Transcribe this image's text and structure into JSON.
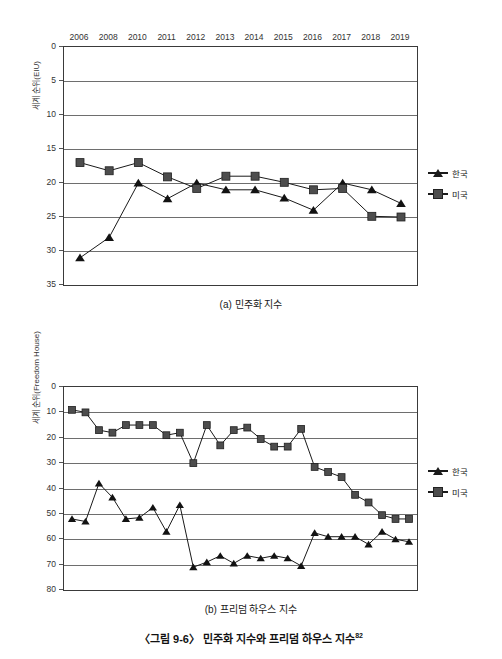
{
  "figure": {
    "caption": "〈그림 9-6〉 민주화 지수와 프리덤 하우스 지수",
    "footnote_marker": "82"
  },
  "legend": {
    "korea_label": "한국",
    "usa_label": "미국",
    "korea_marker": "triangle-marker",
    "usa_marker": "square-marker",
    "korea_color": "#1a1a1a",
    "usa_color": "#4d4d4d"
  },
  "chart_data": [
    {
      "id": "democracy-index",
      "type": "line",
      "title": "(a) 민주화 지수",
      "xlabel": "",
      "ylabel": "세계 순위(EIU)",
      "x_axis_position": "top",
      "y_inverted": true,
      "ylim": [
        0,
        35
      ],
      "yticks": [
        0,
        5,
        10,
        15,
        20,
        25,
        30,
        35
      ],
      "grid": true,
      "legend_position": "right",
      "categories": [
        "2006",
        "2008",
        "2010",
        "2011",
        "2012",
        "2013",
        "2014",
        "2015",
        "2016",
        "2017",
        "2018",
        "2019"
      ],
      "series": [
        {
          "name": "한국",
          "marker": "triangle",
          "values": [
            31,
            28,
            20,
            22.3,
            20,
            21,
            21,
            22.2,
            24,
            20,
            21,
            23
          ]
        },
        {
          "name": "미국",
          "marker": "square",
          "values": [
            17,
            18.2,
            17,
            19.1,
            20.8,
            19,
            19,
            19.9,
            21,
            20.8,
            24.9,
            25
          ]
        }
      ]
    },
    {
      "id": "freedom-house-index",
      "type": "line",
      "title": "(b) 프리덤 하우스 지수",
      "xlabel": "",
      "ylabel": "세계 순위(Freedom House)",
      "x_axis_position": "top",
      "y_inverted": true,
      "ylim": [
        0,
        80
      ],
      "yticks": [
        0,
        10,
        20,
        30,
        40,
        50,
        60,
        70,
        80
      ],
      "grid": true,
      "legend_position": "right",
      "categories": [
        "1994",
        "1995",
        "1996",
        "1997",
        "1998",
        "1999",
        "2000",
        "2001",
        "2002",
        "2003",
        "2004",
        "2005",
        "2006",
        "2007",
        "2008",
        "2009",
        "2010",
        "2011",
        "2012",
        "2013",
        "2014",
        "2015",
        "2016",
        "2017",
        "2018",
        "2019"
      ],
      "series": [
        {
          "name": "한국",
          "marker": "triangle",
          "values": [
            52,
            53,
            38,
            43.5,
            52,
            51.5,
            47.5,
            57,
            46.5,
            71,
            69,
            66.5,
            69.5,
            66.5,
            67.5,
            66.5,
            67.5,
            70.5,
            57.5,
            59,
            59,
            59,
            62,
            57,
            60,
            61
          ]
        },
        {
          "name": "미국",
          "marker": "square",
          "values": [
            9,
            10,
            17,
            18,
            15,
            15,
            15,
            19,
            18,
            30,
            15,
            23,
            17,
            16,
            20.5,
            23.5,
            23.5,
            16.5,
            31.5,
            33.5,
            35.5,
            42.5,
            45.5,
            50.5,
            52,
            52
          ]
        }
      ]
    }
  ]
}
